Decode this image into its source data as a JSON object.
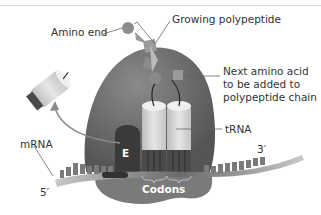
{
  "diagram": {
    "labels": {
      "amino_end": "Amino end",
      "growing_polypeptide": "Growing polypeptide",
      "next_amino_acid_line1": "Next amino acid",
      "next_amino_acid_line2": "to be added to",
      "next_amino_acid_line3": "polypeptide chain",
      "trna": "tRNA",
      "mrna": "mRNA",
      "five_prime": "5′",
      "three_prime": "3′",
      "e_site": "E",
      "codons": "Codons"
    },
    "colors": {
      "ribosome_large": "#6b6b6b",
      "ribosome_small": "#777777",
      "e_site": "#3d3d3d",
      "trna": "#d8d8d8",
      "mrna": "#555555",
      "amino_acid": "#8a8a8a"
    }
  }
}
